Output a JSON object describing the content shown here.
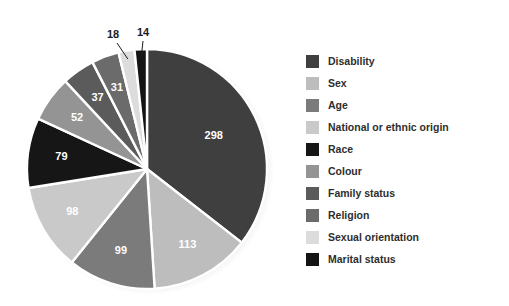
{
  "chart_data": {
    "type": "pie",
    "title": "",
    "subtitle": "",
    "xlabel": "",
    "ylabel": "",
    "grid": false,
    "legend_position": "right",
    "total": 841,
    "start_angle_deg": 0,
    "direction": "clockwise",
    "categories": [
      "Disability",
      "Sex",
      "Age",
      "National or ethnic origin",
      "Race",
      "Colour",
      "Family status",
      "Religion",
      "Sexual orientation",
      "Marital status"
    ],
    "values": [
      298,
      113,
      99,
      98,
      79,
      52,
      37,
      31,
      18,
      14
    ],
    "colors": [
      "#3f3f3f",
      "#bdbdbd",
      "#7b7b7b",
      "#c9c9c9",
      "#161616",
      "#949494",
      "#5b5b5b",
      "#6b6b6b",
      "#dcdcdc",
      "#141414"
    ],
    "label_colors": [
      "#ffffff",
      "#ffffff",
      "#ffffff",
      "#ffffff",
      "#ffffff",
      "#ffffff",
      "#ffffff",
      "#ffffff",
      "#1c1c1c",
      "#1c1c1c"
    ],
    "callout_labels": [
      "Sexual orientation",
      "Marital status"
    ],
    "slices": [
      {
        "label": "Disability",
        "value": 298,
        "value_text": "298",
        "color": "#3f3f3f",
        "callout": false
      },
      {
        "label": "Sex",
        "value": 113,
        "value_text": "113",
        "color": "#bdbdbd",
        "callout": false
      },
      {
        "label": "Age",
        "value": 99,
        "value_text": "99",
        "color": "#7b7b7b",
        "callout": false
      },
      {
        "label": "National or ethnic origin",
        "value": 98,
        "value_text": "98",
        "color": "#c9c9c9",
        "callout": false
      },
      {
        "label": "Race",
        "value": 79,
        "value_text": "79",
        "color": "#161616",
        "callout": false
      },
      {
        "label": "Colour",
        "value": 52,
        "value_text": "52",
        "color": "#949494",
        "callout": false
      },
      {
        "label": "Family status",
        "value": 37,
        "value_text": "37",
        "color": "#5b5b5b",
        "callout": false
      },
      {
        "label": "Religion",
        "value": 31,
        "value_text": "31",
        "color": "#6b6b6b",
        "callout": false
      },
      {
        "label": "Sexual orientation",
        "value": 18,
        "value_text": "18",
        "color": "#dcdcdc",
        "callout": true
      },
      {
        "label": "Marital status",
        "value": 14,
        "value_text": "14",
        "color": "#141414",
        "callout": true
      }
    ]
  },
  "legend": {
    "items": [
      {
        "label": "Disability",
        "color": "#3f3f3f"
      },
      {
        "label": "Sex",
        "color": "#bdbdbd"
      },
      {
        "label": "Age",
        "color": "#7b7b7b"
      },
      {
        "label": "National or ethnic origin",
        "color": "#c9c9c9"
      },
      {
        "label": "Race",
        "color": "#161616"
      },
      {
        "label": "Colour",
        "color": "#949494"
      },
      {
        "label": "Family status",
        "color": "#5b5b5b"
      },
      {
        "label": "Religion",
        "color": "#6b6b6b"
      },
      {
        "label": "Sexual orientation",
        "color": "#dcdcdc"
      },
      {
        "label": "Marital status",
        "color": "#141414"
      }
    ]
  },
  "style": {
    "background": "#ffffff",
    "slice_separator": "#ffffff",
    "callout_line": "#1c1c1c",
    "legend_text": "#2e2e2e"
  }
}
